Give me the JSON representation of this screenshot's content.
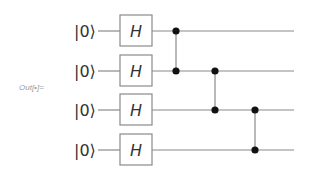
{
  "cell": {
    "output_label": "Out[•]="
  },
  "circuit": {
    "qubits": [
      {
        "initial_state": "|0⟩",
        "gate": "H"
      },
      {
        "initial_state": "|0⟩",
        "gate": "H"
      },
      {
        "initial_state": "|0⟩",
        "gate": "H"
      },
      {
        "initial_state": "|0⟩",
        "gate": "H"
      }
    ],
    "controlled_z_pairs": [
      [
        0,
        1
      ],
      [
        1,
        2
      ],
      [
        2,
        3
      ]
    ],
    "colors": {
      "wire": "#8a8a8a",
      "gate_border": "#8a8a8a",
      "dot": "#111111",
      "text": "#333333"
    }
  }
}
